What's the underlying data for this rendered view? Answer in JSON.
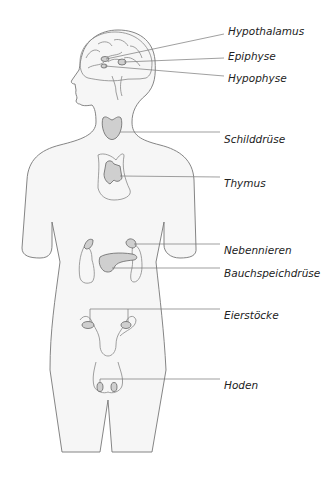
{
  "diagram": {
    "title": "",
    "colors": {
      "body_fill": "#f6f6f6",
      "outline": "#777777",
      "gland_fill": "#cfcfcf",
      "label_text": "#222222"
    },
    "labels": [
      {
        "id": "hypothalamus",
        "text": "Hypothalamus"
      },
      {
        "id": "epiphyse",
        "text": "Epiphyse"
      },
      {
        "id": "hypophyse",
        "text": "Hypophyse"
      },
      {
        "id": "schilddruese",
        "text": "Schilddrüse"
      },
      {
        "id": "thymus",
        "text": "Thymus"
      },
      {
        "id": "nebennieren",
        "text": "Nebennieren"
      },
      {
        "id": "bauchspeicheldruese",
        "text": "Bauchspeichdrüse"
      },
      {
        "id": "eierstoecke",
        "text": "Eierstöcke"
      },
      {
        "id": "hoden",
        "text": "Hoden"
      }
    ]
  }
}
